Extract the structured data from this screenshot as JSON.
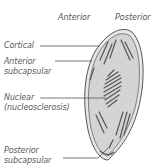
{
  "headers": {
    "anterior": "Anterior",
    "posterior": "Posterior"
  },
  "labels": {
    "cortical": "Cortical",
    "anterior_subcapsular_1": "Anterior",
    "anterior_subcapsular_2": "subcapsular",
    "nuclear_1": "Nuclear",
    "nuclear_2": "(nucleosclerosis)",
    "posterior_subcapsular_1": "Posterior",
    "posterior_subcapsular_2": "subcapsular"
  },
  "colors": {
    "lens_fill": "#d4d4d4",
    "outline": "#555555",
    "text": "#5a5a5a"
  }
}
